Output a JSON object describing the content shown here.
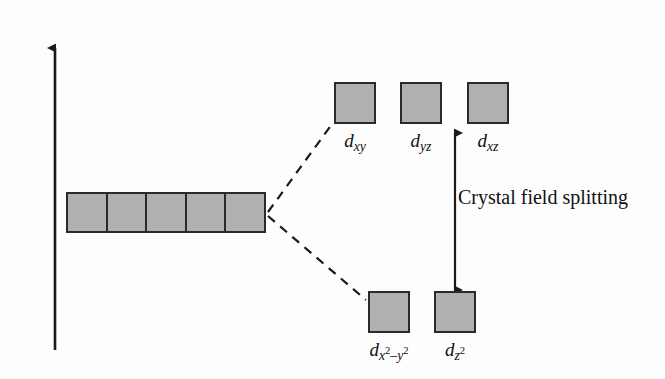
{
  "diagram": {
    "axis": {
      "label": "Energy",
      "direction": "up"
    },
    "annotation": {
      "splitting_label": "Crystal field splitting"
    },
    "colors": {
      "box_fill": "#b0b0b0",
      "box_border": "#2a2a2a",
      "line": "#1a1a1a",
      "background": "#fdfdfd"
    },
    "degenerate_set": {
      "name": "free-ion degenerate d orbitals",
      "count": 5,
      "cells": [
        "",
        "",
        "",
        "",
        ""
      ]
    },
    "upper_level": {
      "orbitals": [
        {
          "symbol": "d",
          "sub": "xy",
          "label": "dxy"
        },
        {
          "symbol": "d",
          "sub": "yz",
          "label": "dyz"
        },
        {
          "symbol": "d",
          "sub": "xz",
          "label": "dxz"
        }
      ]
    },
    "lower_level": {
      "orbitals": [
        {
          "symbol": "d",
          "sub": "x",
          "sup1": "2",
          "mid": "–y",
          "sup2": "2",
          "label": "dx2-y2"
        },
        {
          "symbol": "d",
          "sub": "z",
          "sup1": "2",
          "label": "dz2"
        }
      ]
    }
  }
}
